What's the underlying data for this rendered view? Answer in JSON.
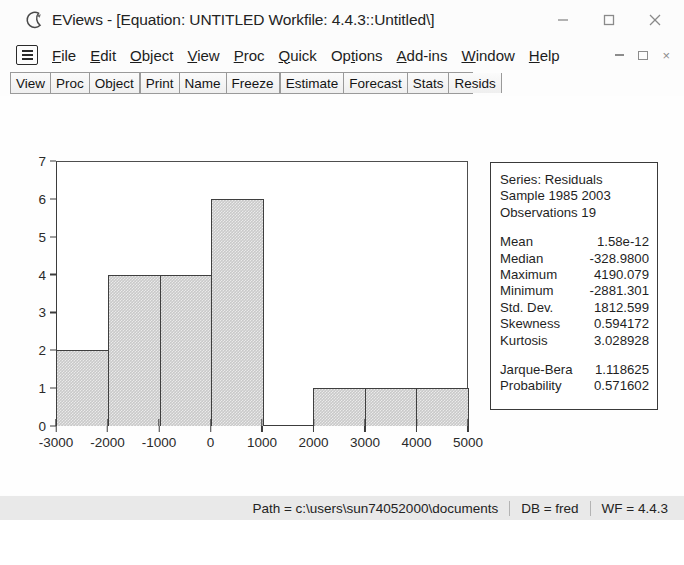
{
  "window": {
    "app_icon": "eviews-logo-icon",
    "title": "EViews - [Equation: UNTITLED   Workfile: 4.4.3::Untitled\\]",
    "controls": {
      "minimize": "minimize-icon",
      "maximize": "maximize-icon",
      "close": "close-icon"
    }
  },
  "menubar": {
    "system_button": "system-menu-icon",
    "items": [
      {
        "label": "File",
        "accel": "F"
      },
      {
        "label": "Edit",
        "accel": "E"
      },
      {
        "label": "Object",
        "accel": "O"
      },
      {
        "label": "View",
        "accel": "V"
      },
      {
        "label": "Proc",
        "accel": "P"
      },
      {
        "label": "Quick",
        "accel": "Q"
      },
      {
        "label": "Options",
        "accel": "t"
      },
      {
        "label": "Add-ins",
        "accel": "A"
      },
      {
        "label": "Window",
        "accel": "W"
      },
      {
        "label": "Help",
        "accel": "H"
      }
    ],
    "mdi_controls": {
      "minimize": "mdi-minimize-icon",
      "restore": "mdi-restore-icon",
      "close": "mdi-close-icon",
      "close_label": "×"
    }
  },
  "toolbar": {
    "groups": [
      [
        "View",
        "Proc",
        "Object"
      ],
      [
        "Print",
        "Name",
        "Freeze"
      ],
      [
        "Estimate",
        "Forecast",
        "Stats",
        "Resids"
      ]
    ]
  },
  "chart_data": {
    "type": "bar",
    "title": "",
    "xlabel": "",
    "ylabel": "",
    "categories": [
      "-3000 to -2000",
      "-2000 to -1000",
      "-1000 to 0",
      "0 to 1000",
      "1000 to 2000",
      "2000 to 3000",
      "3000 to 4000",
      "4000 to 5000"
    ],
    "values": [
      2,
      4,
      4,
      6,
      0,
      1,
      1,
      1
    ],
    "bin_edges": [
      -3000,
      -2000,
      -1000,
      0,
      1000,
      2000,
      3000,
      4000,
      5000
    ],
    "xlim": [
      -3000,
      5000
    ],
    "ylim": [
      0,
      7
    ],
    "xticks": [
      "-3000",
      "-2000",
      "-1000",
      "0",
      "1000",
      "2000",
      "3000",
      "4000",
      "5000"
    ],
    "xtick_values": [
      -3000,
      -2000,
      -1000,
      0,
      1000,
      2000,
      3000,
      4000,
      5000
    ],
    "yticks": [
      "0",
      "1",
      "2",
      "3",
      "4",
      "5",
      "6",
      "7"
    ],
    "ytick_values": [
      0,
      1,
      2,
      3,
      4,
      5,
      6,
      7
    ],
    "grid": false,
    "legend": false,
    "bar_fill": "#c9c9c9",
    "bar_edge": "#3f3f3f"
  },
  "stats": {
    "header": {
      "series": "Series: Residuals",
      "sample": "Sample 1985 2003",
      "observations": "Observations 19"
    },
    "rows": [
      {
        "key": "Mean",
        "value": "1.58e-12"
      },
      {
        "key": "Median",
        "value": "-328.9800"
      },
      {
        "key": "Maximum",
        "value": " 4190.079"
      },
      {
        "key": "Minimum",
        "value": "-2881.301"
      },
      {
        "key": "Std. Dev.",
        "value": " 1812.599"
      },
      {
        "key": "Skewness",
        "value": " 0.594172"
      },
      {
        "key": "Kurtosis",
        "value": " 3.028928"
      }
    ],
    "tests": [
      {
        "key": "Jarque-Bera",
        "value": "1.118625"
      },
      {
        "key": "Probability",
        "value": "0.571602"
      }
    ]
  },
  "statusbar": {
    "path": "Path = c:\\users\\sun74052000\\documents",
    "db": "DB = fred",
    "wf": "WF = 4.4.3"
  }
}
